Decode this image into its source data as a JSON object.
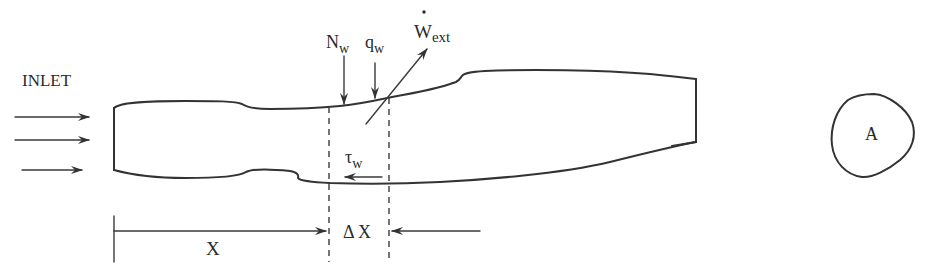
{
  "figure": {
    "colors": {
      "ink": "#333333",
      "background": "#ffffff",
      "bleed_through": "#f3f3f3"
    },
    "labels": {
      "inlet": "INLET",
      "normal_force": {
        "main": "N",
        "sub": "w"
      },
      "heat_flux": {
        "main": "q",
        "sub": "w"
      },
      "work": {
        "main": "W",
        "sub": "ext",
        "accent": "dot-above"
      },
      "shear": {
        "main": "τ",
        "sub": "w"
      },
      "x_distance": "X",
      "delta_x": "Δ X",
      "area": "A"
    },
    "elements": {
      "inflow_arrows": 3,
      "section_boundaries": 2,
      "cross_section_shape": "irregular closed curve"
    }
  }
}
